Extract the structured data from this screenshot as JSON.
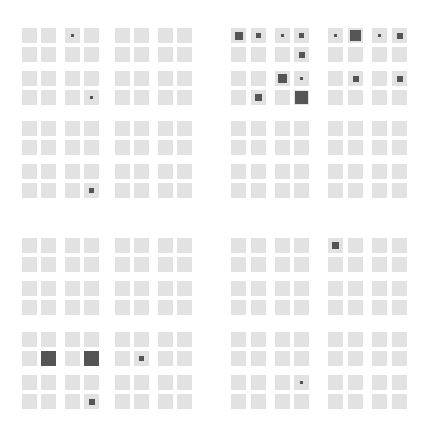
{
  "figure": {
    "cell_size": 15,
    "colors": {
      "background": "#ffffff",
      "cell": "#e2e2e2",
      "marker": "#555555"
    },
    "col_positions": [
      22,
      41,
      65,
      84,
      115,
      134,
      158,
      177,
      231,
      251,
      275,
      294,
      328,
      348,
      372,
      392
    ],
    "row_positions": [
      28,
      47,
      71,
      90,
      121,
      140,
      164,
      183,
      238,
      257,
      281,
      300,
      332,
      351,
      375,
      394
    ],
    "markers": [
      {
        "row": 0,
        "col": 2,
        "size": 3
      },
      {
        "row": 3,
        "col": 3,
        "size": 3
      },
      {
        "row": 7,
        "col": 3,
        "size": 5
      },
      {
        "row": 0,
        "col": 8,
        "size": 8
      },
      {
        "row": 0,
        "col": 9,
        "size": 5
      },
      {
        "row": 0,
        "col": 10,
        "size": 3
      },
      {
        "row": 0,
        "col": 11,
        "size": 5
      },
      {
        "row": 1,
        "col": 11,
        "size": 6
      },
      {
        "row": 2,
        "col": 10,
        "size": 9
      },
      {
        "row": 2,
        "col": 11,
        "size": 3
      },
      {
        "row": 3,
        "col": 9,
        "size": 7
      },
      {
        "row": 3,
        "col": 11,
        "size": 13
      },
      {
        "row": 0,
        "col": 12,
        "size": 3
      },
      {
        "row": 0,
        "col": 13,
        "size": 11
      },
      {
        "row": 0,
        "col": 14,
        "size": 3
      },
      {
        "row": 0,
        "col": 15,
        "size": 6
      },
      {
        "row": 2,
        "col": 13,
        "size": 6
      },
      {
        "row": 2,
        "col": 15,
        "size": 6
      },
      {
        "row": 13,
        "col": 1,
        "size": 15
      },
      {
        "row": 13,
        "col": 3,
        "size": 15
      },
      {
        "row": 15,
        "col": 3,
        "size": 6
      },
      {
        "row": 13,
        "col": 5,
        "size": 5
      },
      {
        "row": 8,
        "col": 12,
        "size": 7
      },
      {
        "row": 14,
        "col": 11,
        "size": 3
      }
    ]
  }
}
